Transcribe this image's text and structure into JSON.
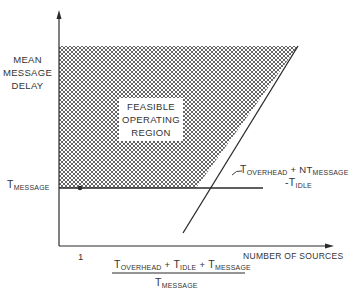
{
  "diagram": {
    "y_axis_label": [
      "MEAN",
      "MESSAGE",
      "DELAY"
    ],
    "x_axis_label": "NUMBER OF SOURCES",
    "region_label": [
      "FEASIBLE",
      "OPERATING",
      "REGION"
    ],
    "y_tick": {
      "main": "T",
      "sub": "MESSAGE"
    },
    "x_tick_one": "1",
    "x_tick_formula": {
      "numerator": [
        {
          "main": "T",
          "sub": "OVERHEAD"
        },
        {
          "op": "+"
        },
        {
          "main": "T",
          "sub": "IDLE"
        },
        {
          "op": "+"
        },
        {
          "main": "T",
          "sub": "MESSAGE"
        }
      ],
      "denominator": {
        "main": "T",
        "sub": "MESSAGE"
      }
    },
    "line_formula": {
      "line1": [
        {
          "main": "T",
          "sub": "OVERHEAD"
        },
        {
          "op": " + NT"
        },
        {
          "sub": "MESSAGE"
        }
      ],
      "line2": [
        {
          "op": "-T"
        },
        {
          "sub": "IDLE"
        }
      ]
    },
    "colors": {
      "ink": "#2a2a2a",
      "hatch": "#555555",
      "background": "#ffffff"
    }
  }
}
